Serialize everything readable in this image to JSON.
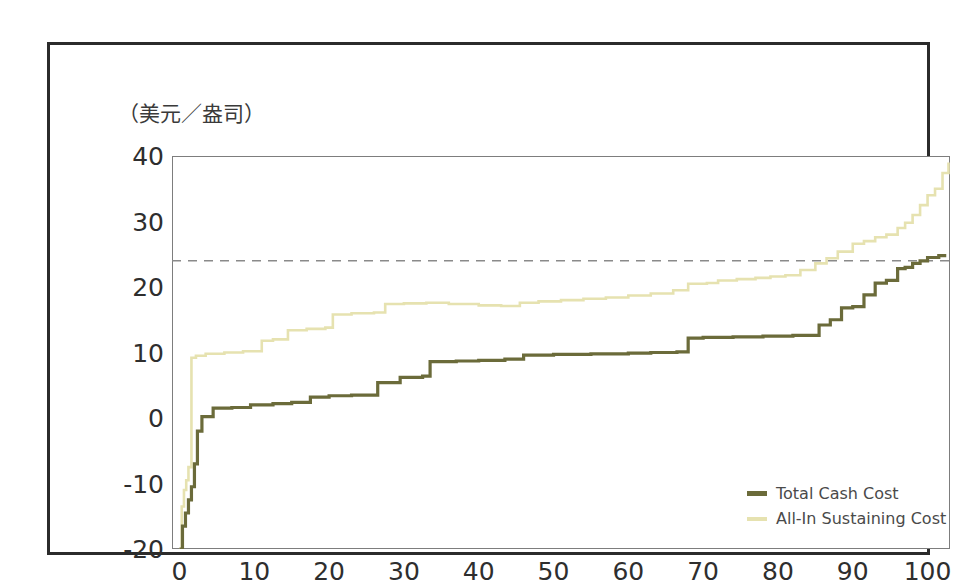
{
  "figure": {
    "unit_label": "（美元／盎司）"
  },
  "legend": {
    "position": "bottom-right",
    "items": [
      {
        "label": "Total Cash Cost",
        "color": "#6b6b3a"
      },
      {
        "label": "All-In Sustaining Cost",
        "color": "#e6e2b0"
      }
    ]
  },
  "colors": {
    "total_cash_cost": "#6b6b3a",
    "all_in_sustaining_cost": "#e6e2b0",
    "reference_line": "#8a8a8a",
    "axis": "#7d7d7d",
    "frame": "#2b2b2b",
    "text": "#2e2e2e"
  },
  "chart_data": {
    "type": "line",
    "title": "",
    "subtitle": "",
    "xlabel": "",
    "ylabel": "（美元／盎司）",
    "xlim": [
      -1,
      103
    ],
    "ylim": [
      -20,
      40
    ],
    "xticks": [
      0,
      10,
      20,
      30,
      40,
      50,
      60,
      70,
      80,
      90,
      100
    ],
    "yticks": [
      -20,
      -10,
      0,
      10,
      20,
      30,
      40
    ],
    "grid": false,
    "legend_position": "bottom-right",
    "annotations": [
      {
        "type": "horizontal-reference-line",
        "value": 24,
        "style": "dashed",
        "color": "#8a8a8a",
        "label": ""
      }
    ],
    "series": [
      {
        "name": "Total Cash Cost",
        "color": "#6b6b3a",
        "step": "post",
        "x": [
          0,
          0.4,
          0.8,
          1.2,
          1.6,
          2.0,
          2.4,
          3.0,
          4.5,
          7.0,
          9.5,
          12.5,
          15.0,
          17.5,
          20.0,
          23.0,
          26.5,
          29.5,
          32.5,
          33.5,
          37.0,
          40.0,
          43.5,
          46.0,
          50.0,
          55.0,
          60.0,
          63.0,
          66.5,
          68.0,
          70.0,
          74.0,
          78.0,
          82.0,
          85.5,
          87.0,
          88.5,
          90.0,
          91.5,
          93.0,
          94.5,
          96.0,
          97.0,
          98.0,
          99.0,
          100.0,
          101.5,
          102.5
        ],
        "y": [
          -20.0,
          -16.5,
          -14.5,
          -12.5,
          -10.5,
          -7.0,
          -2.0,
          0.2,
          1.5,
          1.6,
          2.0,
          2.2,
          2.4,
          3.2,
          3.4,
          3.5,
          5.4,
          6.2,
          6.4,
          8.6,
          8.7,
          8.8,
          9.0,
          9.6,
          9.7,
          9.8,
          9.9,
          10.0,
          10.1,
          12.2,
          12.3,
          12.4,
          12.5,
          12.6,
          14.2,
          15.0,
          16.8,
          17.0,
          18.8,
          20.6,
          21.0,
          22.8,
          23.0,
          23.6,
          24.0,
          24.5,
          24.8,
          24.8
        ]
      },
      {
        "name": "All-In Sustaining Cost",
        "color": "#e6e2b0",
        "step": "post",
        "x": [
          0,
          0.3,
          0.6,
          0.9,
          1.2,
          1.6,
          2.2,
          3.5,
          6.0,
          8.5,
          11.0,
          12.5,
          14.5,
          17.0,
          19.5,
          20.5,
          23.0,
          26.0,
          27.5,
          30.0,
          33.0,
          36.0,
          40.0,
          43.0,
          45.5,
          48.0,
          51.0,
          54.0,
          57.0,
          60.0,
          63.0,
          66.0,
          68.0,
          70.5,
          72.0,
          74.5,
          77.0,
          79.0,
          81.0,
          83.0,
          85.0,
          86.5,
          88.0,
          90.0,
          91.5,
          93.0,
          94.5,
          96.0,
          97.0,
          98.0,
          99.0,
          100.0,
          101.0,
          102.0,
          102.8
        ],
        "y": [
          -20.0,
          -13.5,
          -11.0,
          -9.5,
          -7.5,
          9.2,
          9.5,
          9.8,
          10.0,
          10.2,
          11.8,
          12.0,
          13.4,
          13.6,
          13.8,
          15.8,
          16.0,
          16.1,
          17.4,
          17.5,
          17.6,
          17.4,
          17.2,
          17.1,
          17.6,
          17.8,
          18.0,
          18.2,
          18.4,
          18.7,
          19.0,
          19.5,
          20.5,
          20.6,
          21.0,
          21.2,
          21.4,
          21.6,
          21.8,
          22.6,
          23.6,
          24.4,
          25.4,
          26.6,
          27.0,
          27.6,
          28.0,
          29.0,
          29.8,
          31.0,
          32.5,
          34.0,
          35.0,
          37.4,
          39.0
        ]
      }
    ]
  }
}
